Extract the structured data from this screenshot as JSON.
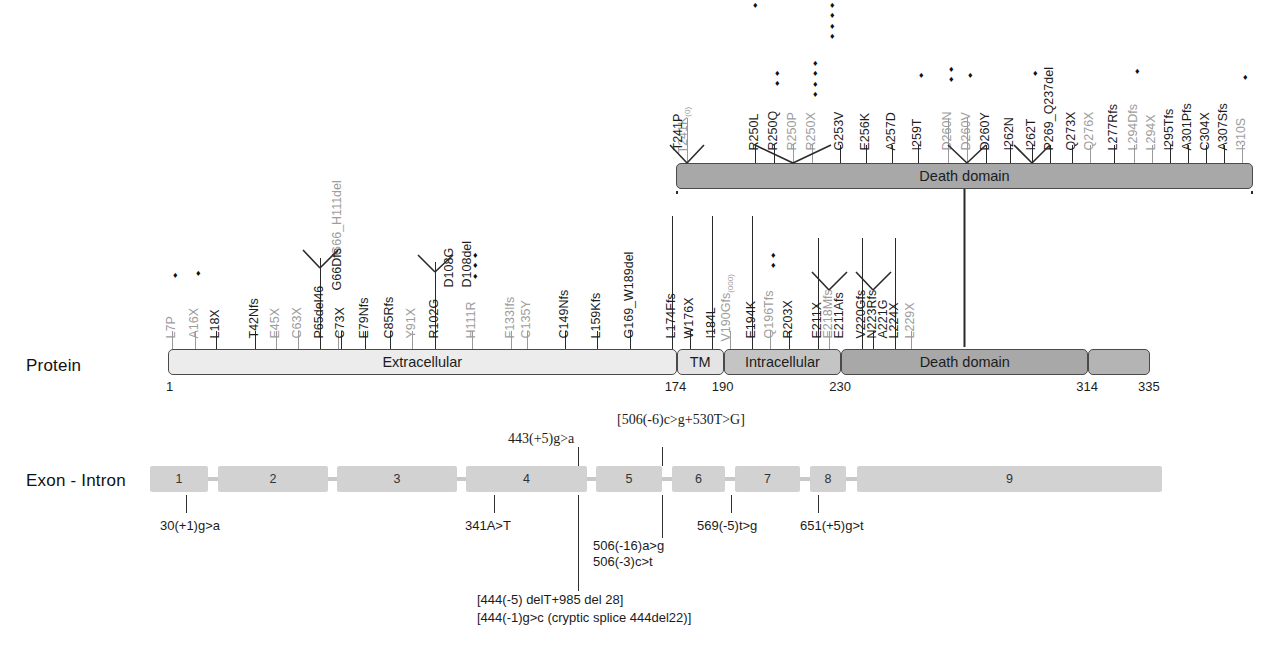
{
  "figure": {
    "rows": {
      "protein_label": "Protein",
      "exon_label": "Exon - Intron"
    }
  },
  "protein": {
    "domains": [
      {
        "name": "Extracellular",
        "label": "Extracellular",
        "start": 1,
        "end": 174
      },
      {
        "name": "TM",
        "label": "TM",
        "start": 174,
        "end": 190
      },
      {
        "name": "Intracellular",
        "label": "Intracellular",
        "start": 190,
        "end": 230
      },
      {
        "name": "DeathDomain",
        "label": "Death domain",
        "start": 230,
        "end": 314
      },
      {
        "name": "Tail",
        "label": "",
        "start": 314,
        "end": 335
      }
    ],
    "positions": [
      "1",
      "174",
      "190",
      "230",
      "314",
      "335"
    ],
    "zoom_panel": {
      "label": "Death domain",
      "range_start": 230,
      "range_end": 335
    }
  },
  "mutations_protein": [
    {
      "label": "L7P",
      "diamonds": 1,
      "color": "gray"
    },
    {
      "label": "A16X",
      "diamonds": 1,
      "color": "gray"
    },
    {
      "label": "L18X",
      "diamonds": 0,
      "color": "black"
    },
    {
      "label": "T42Nfs",
      "diamonds": 0,
      "color": "black"
    },
    {
      "label": "E45X",
      "diamonds": 0,
      "color": "gray"
    },
    {
      "label": "C63X",
      "diamonds": 0,
      "color": "gray"
    },
    {
      "label": "P65del46",
      "diamonds": 0,
      "color": "black"
    },
    {
      "label": "G66_H111del",
      "diamonds": 0,
      "color": "gray"
    },
    {
      "label": "G66Dfs",
      "diamonds": 0,
      "color": "black"
    },
    {
      "label": "C73X",
      "diamonds": 0,
      "color": "black"
    },
    {
      "label": "E79Nfs",
      "diamonds": 0,
      "color": "black"
    },
    {
      "label": "C85Rfs",
      "diamonds": 0,
      "color": "black"
    },
    {
      "label": "Y91X",
      "diamonds": 0,
      "color": "gray"
    },
    {
      "label": "R102G",
      "diamonds": 0,
      "color": "black"
    },
    {
      "label": "D108G",
      "diamonds": 0,
      "color": "black"
    },
    {
      "label": "D108del",
      "diamonds": 0,
      "color": "black"
    },
    {
      "label": "H111R",
      "diamonds": 3,
      "color": "gray"
    },
    {
      "label": "F133Ifs",
      "diamonds": 0,
      "color": "gray"
    },
    {
      "label": "C135Y",
      "diamonds": 0,
      "color": "gray"
    },
    {
      "label": "C149Nfs",
      "diamonds": 0,
      "color": "black"
    },
    {
      "label": "L159Kfs",
      "diamonds": 0,
      "color": "black"
    },
    {
      "label": "G169_W189del",
      "diamonds": 0,
      "color": "black"
    },
    {
      "label": "L174Ffs",
      "diamonds": 0,
      "color": "black"
    },
    {
      "label": "W176X",
      "diamonds": 0,
      "color": "black"
    },
    {
      "label": "I184L",
      "diamonds": 0,
      "color": "black"
    },
    {
      "label": "V190Gfs",
      "subscript": "(000)",
      "diamonds": 0,
      "color": "gray"
    },
    {
      "label": "E194K",
      "diamonds": 1,
      "color": "black"
    },
    {
      "label": "Q196Tfs",
      "diamonds": 2,
      "color": "gray"
    },
    {
      "label": "R203X",
      "diamonds": 0,
      "color": "black"
    },
    {
      "label": "E211X",
      "diamonds": 0,
      "color": "black"
    },
    {
      "label": "E211Afs",
      "diamonds": 0,
      "color": "black"
    },
    {
      "label": "E218Mfs",
      "diamonds": 4,
      "color": "gray"
    },
    {
      "label": "V220Gfs",
      "diamonds": 0,
      "color": "black"
    },
    {
      "label": "A221G",
      "diamonds": 0,
      "color": "black"
    },
    {
      "label": "N223Rfs",
      "diamonds": 0,
      "color": "black"
    },
    {
      "label": "L224X",
      "diamonds": 0,
      "color": "black"
    },
    {
      "label": "L229X",
      "diamonds": 0,
      "color": "gray"
    }
  ],
  "mutations_death_domain": [
    {
      "label": "T241K",
      "subscript": "(0)",
      "diamonds": 0,
      "color": "gray"
    },
    {
      "label": "T241P",
      "diamonds": 0,
      "color": "black"
    },
    {
      "label": "R250L",
      "diamonds": 0,
      "color": "black"
    },
    {
      "label": "R250Q",
      "diamonds": 2,
      "color": "black"
    },
    {
      "label": "R250P",
      "diamonds": 0,
      "color": "gray"
    },
    {
      "label": "R250X",
      "diamonds": 4,
      "color": "gray"
    },
    {
      "label": "G253V",
      "diamonds": 0,
      "color": "black"
    },
    {
      "label": "E256K",
      "diamonds": 0,
      "color": "black"
    },
    {
      "label": "A257D",
      "diamonds": 0,
      "color": "black"
    },
    {
      "label": "I259T",
      "diamonds": 1,
      "color": "black"
    },
    {
      "label": "D260N",
      "diamonds": 2,
      "color": "gray"
    },
    {
      "label": "D260V",
      "diamonds": 1,
      "color": "gray"
    },
    {
      "label": "D260Y",
      "diamonds": 0,
      "color": "black"
    },
    {
      "label": "I262N",
      "diamonds": 0,
      "color": "black"
    },
    {
      "label": "I262T",
      "diamonds": 1,
      "color": "black"
    },
    {
      "label": "P269_Q237del",
      "diamonds": 0,
      "color": "black"
    },
    {
      "label": "Q273X",
      "diamonds": 0,
      "color": "black"
    },
    {
      "label": "Q276X",
      "diamonds": 0,
      "color": "gray"
    },
    {
      "label": "L277Rfs",
      "diamonds": 0,
      "color": "black"
    },
    {
      "label": "L294Dfs",
      "diamonds": 1,
      "color": "gray"
    },
    {
      "label": "L294X",
      "diamonds": 0,
      "color": "gray"
    },
    {
      "label": "I295Tfs",
      "diamonds": 0,
      "color": "black"
    },
    {
      "label": "A301Pfs",
      "diamonds": 0,
      "color": "black"
    },
    {
      "label": "C304X",
      "diamonds": 0,
      "color": "black"
    },
    {
      "label": "A307Sfs",
      "diamonds": 0,
      "color": "black"
    },
    {
      "label": "I310S",
      "diamonds": 1,
      "color": "gray"
    }
  ],
  "exons": [
    {
      "number": "1"
    },
    {
      "number": "2"
    },
    {
      "number": "3"
    },
    {
      "number": "4"
    },
    {
      "number": "5"
    },
    {
      "number": "6"
    },
    {
      "number": "7"
    },
    {
      "number": "8"
    },
    {
      "number": "9"
    }
  ],
  "splice_annotations": {
    "above": [
      {
        "text": "443(+5)g>a"
      },
      {
        "text": "[506(-6)c>g+530T>G]"
      }
    ],
    "below": [
      {
        "text": "30(+1)g>a"
      },
      {
        "text": "341A>T"
      },
      {
        "text": "506(-16)a>g"
      },
      {
        "text": "506(-3)c>t"
      },
      {
        "text": "569(-5)t>g"
      },
      {
        "text": "651(+5)g>t"
      },
      {
        "text": "[444(-5) delT+985 del 28]"
      },
      {
        "text": "[444(-1)g>c (cryptic splice 444del22)]"
      }
    ]
  },
  "colors": {
    "extracellular": "#ececec",
    "tm": "#e4e4e4",
    "intracellular": "#c4c4c4",
    "death_domain": "#a8a8a8",
    "exon": "#d2d2d2",
    "gray_text": "#9d9d9d",
    "black_text": "#1d1d1d"
  }
}
